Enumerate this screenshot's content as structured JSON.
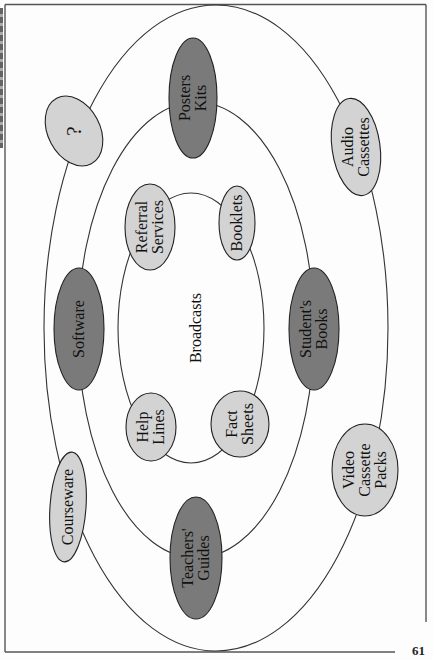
{
  "diagram": {
    "center_label": "Broadcasts",
    "colors": {
      "dark_fill": "#7a7a7a",
      "light_fill": "#d3d3d3",
      "stroke": "#222222",
      "ring_stroke": "#333333"
    },
    "rings": [
      {
        "name": "inner-ring",
        "cx": 191,
        "cy": 328,
        "rx": 73,
        "ry": 135
      },
      {
        "name": "middle-ring",
        "cx": 196,
        "cy": 330,
        "rx": 118,
        "ry": 228
      },
      {
        "name": "outer-ring",
        "cx": 216,
        "cy": 328,
        "rx": 172,
        "ry": 323
      }
    ],
    "nodes": [
      {
        "id": "posters-kits",
        "label": "Posters\nKits",
        "ring": "middle",
        "tone": "dark",
        "cx": 193,
        "cy": 98,
        "rx": 24,
        "ry": 60,
        "rot": 0
      },
      {
        "id": "question",
        "label": "?",
        "ring": "outer",
        "tone": "light",
        "cx": 74,
        "cy": 131,
        "rx": 26,
        "ry": 37,
        "rot": -28
      },
      {
        "id": "audio-cassettes",
        "label": "Audio\nCassettes",
        "ring": "outer",
        "tone": "light",
        "cx": 356,
        "cy": 147,
        "rx": 24,
        "ry": 49,
        "rot": -8
      },
      {
        "id": "referral-services",
        "label": "Referral\nServices",
        "ring": "inner",
        "tone": "light",
        "cx": 150,
        "cy": 227,
        "rx": 25,
        "ry": 43,
        "rot": 0
      },
      {
        "id": "booklets",
        "label": "Booklets",
        "ring": "inner",
        "tone": "light",
        "cx": 237,
        "cy": 223,
        "rx": 18,
        "ry": 37,
        "rot": 0
      },
      {
        "id": "software",
        "label": "Software",
        "ring": "middle",
        "tone": "dark",
        "cx": 79,
        "cy": 329,
        "rx": 25,
        "ry": 61,
        "rot": 0
      },
      {
        "id": "students-books",
        "label": "Student's\nBooks",
        "ring": "middle",
        "tone": "dark",
        "cx": 314,
        "cy": 329,
        "rx": 25,
        "ry": 61,
        "rot": 0
      },
      {
        "id": "help-lines",
        "label": "Help\nLines",
        "ring": "inner",
        "tone": "light",
        "cx": 151,
        "cy": 427,
        "rx": 25,
        "ry": 34,
        "rot": 0
      },
      {
        "id": "fact-sheets",
        "label": "Fact\nSheets",
        "ring": "inner",
        "tone": "light",
        "cx": 240,
        "cy": 424,
        "rx": 29,
        "ry": 33,
        "rot": 0
      },
      {
        "id": "courseware",
        "label": "Courseware",
        "ring": "outer",
        "tone": "light",
        "cx": 68,
        "cy": 507,
        "rx": 18,
        "ry": 55,
        "rot": 4
      },
      {
        "id": "teachers-guides",
        "label": "Teachers'\nGuides",
        "ring": "middle",
        "tone": "dark",
        "cx": 196,
        "cy": 558,
        "rx": 26,
        "ry": 61,
        "rot": 0
      },
      {
        "id": "video-cassette-packs",
        "label": "Video\nCassette\nPacks",
        "ring": "outer",
        "tone": "light",
        "cx": 365,
        "cy": 470,
        "rx": 33,
        "ry": 46,
        "rot": 0
      }
    ]
  },
  "page": {
    "page_number": "61"
  }
}
